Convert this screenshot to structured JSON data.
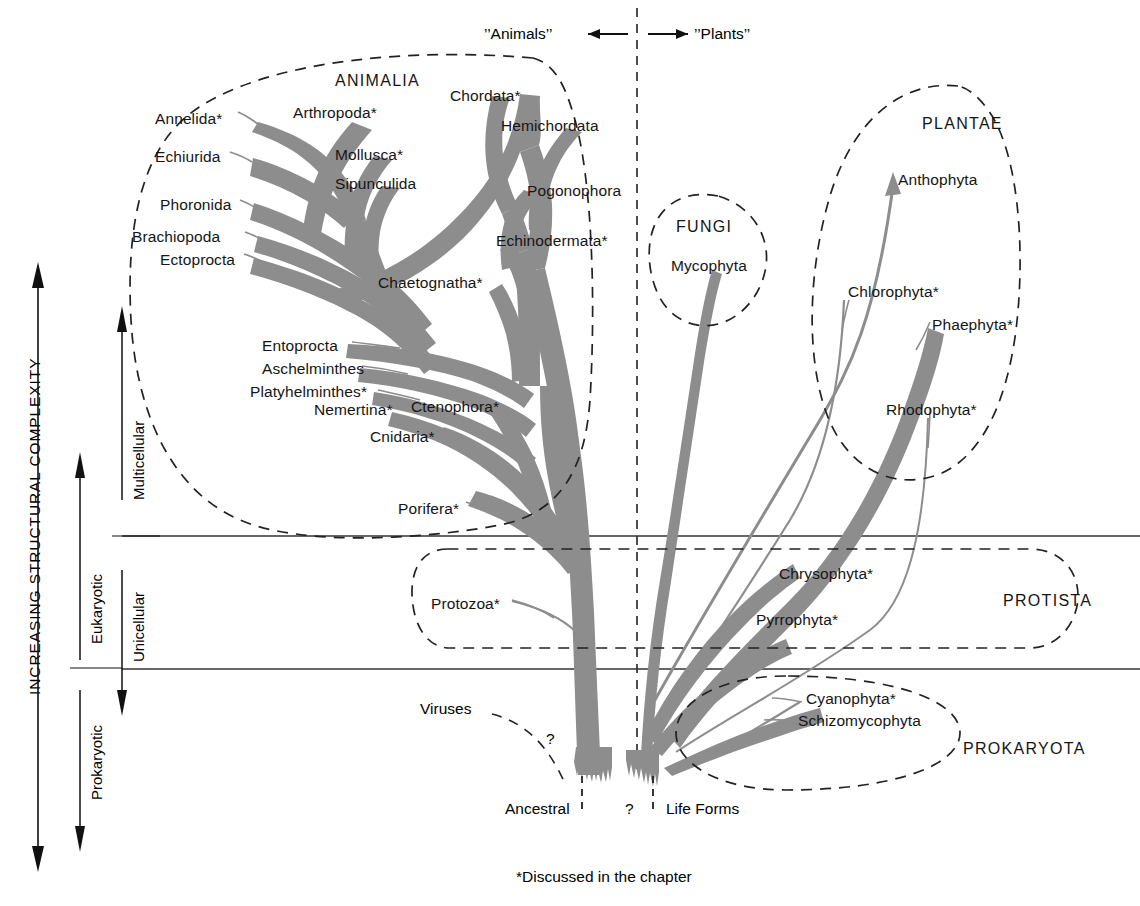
{
  "figure": {
    "title_left": "’’Animals’’",
    "title_right": "’’Plants’’",
    "footnote": "*Discussed in the chapter",
    "root_left": "Ancestral",
    "root_q": "?",
    "root_right": "Life Forms",
    "virus_label": "Viruses",
    "virus_q": "?",
    "branch_color": "#8d8d8d",
    "line_color": "#1a1a1a",
    "text_color": "#151515"
  },
  "axis": {
    "main": "INCREASING STRUCTURAL COMPLEXITY",
    "prokaryotic": "Prokaryotic",
    "eukaryotic": "Eukaryotic",
    "unicellular": "Unicellular",
    "multicellular": "Multicellular"
  },
  "kingdoms": [
    {
      "name": "ANIMALIA",
      "x": 335,
      "y": 73
    },
    {
      "name": "FUNGI",
      "x": 676,
      "y": 219
    },
    {
      "name": "PLANTAE",
      "x": 922,
      "y": 116
    },
    {
      "name": "PROTISTA",
      "x": 1003,
      "y": 593
    },
    {
      "name": "PROKARYOTA",
      "x": 963,
      "y": 741
    }
  ],
  "taxa": [
    {
      "label": "Annelida*",
      "x": 155,
      "y": 111,
      "anchor": "start"
    },
    {
      "label": "Arthropoda*",
      "x": 293,
      "y": 105,
      "anchor": "start"
    },
    {
      "label": "Chordata*",
      "x": 450,
      "y": 88,
      "anchor": "start"
    },
    {
      "label": "Hemichordata",
      "x": 501,
      "y": 118,
      "anchor": "start"
    },
    {
      "label": "Echiurida",
      "x": 155,
      "y": 149,
      "anchor": "start"
    },
    {
      "label": "Mollusca*",
      "x": 335,
      "y": 147,
      "anchor": "start"
    },
    {
      "label": "Sipunculida",
      "x": 335,
      "y": 176,
      "anchor": "start"
    },
    {
      "label": "Pogonophora",
      "x": 527,
      "y": 183,
      "anchor": "start"
    },
    {
      "label": "Phoronida",
      "x": 160,
      "y": 197,
      "anchor": "start"
    },
    {
      "label": "Brachiopoda",
      "x": 132,
      "y": 229,
      "anchor": "start"
    },
    {
      "label": "Ectoprocta",
      "x": 160,
      "y": 252,
      "anchor": "start"
    },
    {
      "label": "Echinodermata*",
      "x": 496,
      "y": 233,
      "anchor": "start"
    },
    {
      "label": "Chaetognatha*",
      "x": 378,
      "y": 275,
      "anchor": "start"
    },
    {
      "label": "Entoprocta",
      "x": 262,
      "y": 338,
      "anchor": "start"
    },
    {
      "label": "Aschelminthes",
      "x": 262,
      "y": 361,
      "anchor": "start"
    },
    {
      "label": "Platyhelminthes*",
      "x": 250,
      "y": 384,
      "anchor": "start"
    },
    {
      "label": "Nemertina*",
      "x": 314,
      "y": 402,
      "anchor": "start"
    },
    {
      "label": "Ctenophora*",
      "x": 411,
      "y": 399,
      "anchor": "start"
    },
    {
      "label": "Cnidaria*",
      "x": 370,
      "y": 429,
      "anchor": "start"
    },
    {
      "label": "Porifera*",
      "x": 398,
      "y": 501,
      "anchor": "start"
    },
    {
      "label": "Mycophyta",
      "x": 671,
      "y": 258,
      "anchor": "start"
    },
    {
      "label": "Anthophyta",
      "x": 898,
      "y": 172,
      "anchor": "start"
    },
    {
      "label": "Chlorophyta*",
      "x": 848,
      "y": 284,
      "anchor": "start"
    },
    {
      "label": "Phaephyta*",
      "x": 932,
      "y": 317,
      "anchor": "start"
    },
    {
      "label": "Rhodophyta*",
      "x": 886,
      "y": 402,
      "anchor": "start"
    },
    {
      "label": "Protozoa*",
      "x": 431,
      "y": 596,
      "anchor": "start"
    },
    {
      "label": "Chrysophyta*",
      "x": 779,
      "y": 566,
      "anchor": "start"
    },
    {
      "label": "Pyrrophyta*",
      "x": 756,
      "y": 612,
      "anchor": "start"
    },
    {
      "label": "Cyanophyta*",
      "x": 806,
      "y": 691,
      "anchor": "start"
    },
    {
      "label": "Schizomycophyta",
      "x": 798,
      "y": 713,
      "anchor": "start"
    }
  ],
  "chart_data": {
    "type": "diagram",
    "xlabel": "",
    "ylabel": "INCREASING STRUCTURAL COMPLEXITY",
    "bands": [
      {
        "name": "Prokaryotic / below",
        "y_top": 669,
        "y_bottom": 800
      },
      {
        "name": "Eukaryotic Unicellular",
        "y_top": 536,
        "y_bottom": 669
      },
      {
        "name": "Eukaryotic Multicellular",
        "y_top": 40,
        "y_bottom": 536
      }
    ],
    "divider_lines_y": [
      536,
      669
    ],
    "animal_plant_divider_x": 637,
    "legend": [
      "*Discussed in the chapter"
    ]
  }
}
